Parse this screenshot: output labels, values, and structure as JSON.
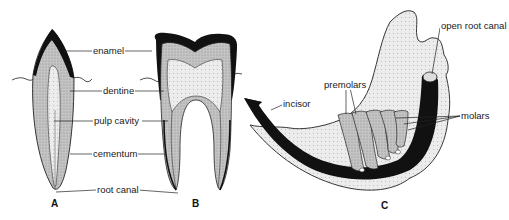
{
  "figure": {
    "panels": [
      {
        "id": "A",
        "label": "A",
        "description": "single-rooted tooth section (incisor-like)"
      },
      {
        "id": "B",
        "label": "B",
        "description": "two-rooted molar section"
      },
      {
        "id": "C",
        "label": "C",
        "description": "rodent lower jaw with ever-growing teeth"
      }
    ],
    "shared_labels": {
      "enamel": "enamel",
      "dentine": "dentine",
      "pulp_cavity": "pulp cavity",
      "cementum": "cementum",
      "root_canal": "root canal"
    },
    "jaw_labels": {
      "open_root_canal": "open root canal",
      "premolars": "premolars",
      "incisor": "incisor",
      "molars": "molars"
    },
    "colors": {
      "enamel": "#111111",
      "dentine": "#bdbdbd",
      "pulp": "#e6e6e6",
      "bone": "#e9e9e9",
      "outline": "#222222",
      "background": "#ffffff"
    }
  }
}
